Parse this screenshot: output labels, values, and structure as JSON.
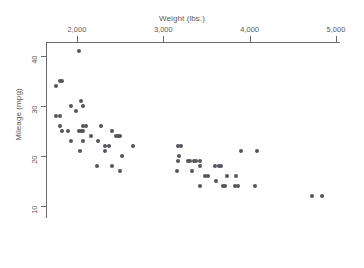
{
  "chart_data": {
    "type": "scatter",
    "title": "",
    "xlabel": "Weight (lbs.)",
    "ylabel": "Mileage (mpg)",
    "xlim": [
      1600,
      5020
    ],
    "ylim": [
      9,
      42
    ],
    "xticks": [
      2000,
      3000,
      4000,
      5000
    ],
    "xtick_labels": [
      "2,000",
      "3,000",
      "4,000",
      "5,000"
    ],
    "yticks": [
      10,
      20,
      30,
      40
    ],
    "ytick_labels": [
      "10",
      "20",
      "30",
      "40"
    ],
    "grid": false,
    "legend": false,
    "marker_color": "#53565c",
    "axis_color": "#6b6b6b",
    "points": [
      {
        "x": 2020,
        "y": 41
      },
      {
        "x": 1800,
        "y": 35
      },
      {
        "x": 1830,
        "y": 35
      },
      {
        "x": 1760,
        "y": 34
      },
      {
        "x": 2050,
        "y": 31
      },
      {
        "x": 1930,
        "y": 30
      },
      {
        "x": 2070,
        "y": 30
      },
      {
        "x": 1990,
        "y": 29
      },
      {
        "x": 1760,
        "y": 28
      },
      {
        "x": 1800,
        "y": 28
      },
      {
        "x": 1800,
        "y": 26
      },
      {
        "x": 2070,
        "y": 26
      },
      {
        "x": 2100,
        "y": 26
      },
      {
        "x": 2280,
        "y": 26
      },
      {
        "x": 1830,
        "y": 25
      },
      {
        "x": 1900,
        "y": 25
      },
      {
        "x": 2020,
        "y": 25
      },
      {
        "x": 2050,
        "y": 25
      },
      {
        "x": 2070,
        "y": 25
      },
      {
        "x": 2410,
        "y": 25
      },
      {
        "x": 2450,
        "y": 24
      },
      {
        "x": 2470,
        "y": 24
      },
      {
        "x": 2500,
        "y": 24
      },
      {
        "x": 2160,
        "y": 24
      },
      {
        "x": 1930,
        "y": 23
      },
      {
        "x": 2070,
        "y": 23
      },
      {
        "x": 2240,
        "y": 23
      },
      {
        "x": 2650,
        "y": 22
      },
      {
        "x": 2320,
        "y": 22
      },
      {
        "x": 2370,
        "y": 22
      },
      {
        "x": 3170,
        "y": 22
      },
      {
        "x": 3210,
        "y": 22
      },
      {
        "x": 2040,
        "y": 21
      },
      {
        "x": 2330,
        "y": 21
      },
      {
        "x": 3900,
        "y": 21
      },
      {
        "x": 4080,
        "y": 21
      },
      {
        "x": 2520,
        "y": 20
      },
      {
        "x": 3180,
        "y": 20
      },
      {
        "x": 3170,
        "y": 19
      },
      {
        "x": 3280,
        "y": 19
      },
      {
        "x": 3310,
        "y": 19
      },
      {
        "x": 3350,
        "y": 19
      },
      {
        "x": 3380,
        "y": 19
      },
      {
        "x": 3420,
        "y": 19
      },
      {
        "x": 2230,
        "y": 18
      },
      {
        "x": 2410,
        "y": 18
      },
      {
        "x": 3430,
        "y": 18
      },
      {
        "x": 3600,
        "y": 18
      },
      {
        "x": 3640,
        "y": 18
      },
      {
        "x": 3670,
        "y": 18
      },
      {
        "x": 2500,
        "y": 17
      },
      {
        "x": 3160,
        "y": 17
      },
      {
        "x": 3330,
        "y": 17
      },
      {
        "x": 3480,
        "y": 16
      },
      {
        "x": 3520,
        "y": 16
      },
      {
        "x": 3740,
        "y": 16
      },
      {
        "x": 3840,
        "y": 16
      },
      {
        "x": 3610,
        "y": 15
      },
      {
        "x": 3430,
        "y": 14
      },
      {
        "x": 3690,
        "y": 14
      },
      {
        "x": 3720,
        "y": 14
      },
      {
        "x": 3830,
        "y": 14
      },
      {
        "x": 3860,
        "y": 14
      },
      {
        "x": 4060,
        "y": 14
      },
      {
        "x": 4720,
        "y": 12
      },
      {
        "x": 4840,
        "y": 12
      }
    ]
  }
}
